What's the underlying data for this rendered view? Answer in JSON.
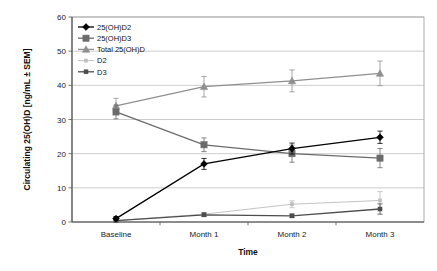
{
  "chart_data": {
    "type": "line",
    "title": "",
    "xlabel": "Time",
    "ylabel": "Circulating 25(OH)D [ng/mL ± SEM]",
    "categories": [
      "Baseline",
      "Month 1",
      "Month 2",
      "Month 3"
    ],
    "ylim": [
      0,
      60
    ],
    "ytick_step": 10,
    "yticks": [
      "0",
      "10",
      "20",
      "30",
      "40",
      "50",
      "60"
    ],
    "grid": true,
    "grid_axis": "y",
    "legend_position": "top-left-inside",
    "series": [
      {
        "name": "25(OH)D2",
        "color": "#000000",
        "marker": "diamond",
        "values": [
          1.0,
          17.0,
          21.5,
          24.8
        ],
        "errors": [
          0.6,
          1.6,
          1.6,
          1.8
        ]
      },
      {
        "name": "25(OH)D3",
        "color": "#6b6b6b",
        "marker": "square",
        "values": [
          32.2,
          22.6,
          20.0,
          18.7
        ],
        "errors": [
          2.0,
          2.0,
          2.5,
          2.8
        ]
      },
      {
        "name": "Total 25(OH)D",
        "color": "#8f8f8f",
        "marker": "triangle",
        "values": [
          34.0,
          39.6,
          41.3,
          43.5
        ],
        "errors": [
          2.2,
          3.0,
          3.2,
          3.6
        ]
      },
      {
        "name": "D2",
        "color": "#bdbdbd",
        "marker": "line",
        "values": [
          0.4,
          2.3,
          5.2,
          6.3
        ],
        "errors": [
          0.3,
          0.5,
          1.0,
          2.6
        ]
      },
      {
        "name": "D3",
        "color": "#4d4d4d",
        "marker": "small-square",
        "values": [
          0.4,
          2.1,
          1.8,
          3.8
        ],
        "errors": [
          0.3,
          0.5,
          0.5,
          1.5
        ]
      }
    ]
  }
}
